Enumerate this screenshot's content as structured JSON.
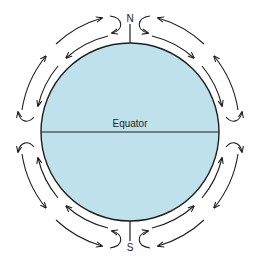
{
  "diagram": {
    "type": "global atmospheric circulation cells",
    "labels": {
      "north": "N",
      "south": "S",
      "equator": "Equator"
    },
    "colors": {
      "globe_fill": "#bfe1ec",
      "outline": "#1e1e1e",
      "arrows": "#1e1e1e",
      "background": "#ffffff"
    },
    "cells": [
      {
        "name": "north-west-cell",
        "direction": "poleward aloft, equatorward near surface"
      },
      {
        "name": "north-east-cell",
        "direction": "poleward aloft, equatorward near surface"
      },
      {
        "name": "south-west-cell",
        "direction": "poleward aloft, equatorward near surface"
      },
      {
        "name": "south-east-cell",
        "direction": "poleward aloft, equatorward near surface"
      }
    ]
  }
}
